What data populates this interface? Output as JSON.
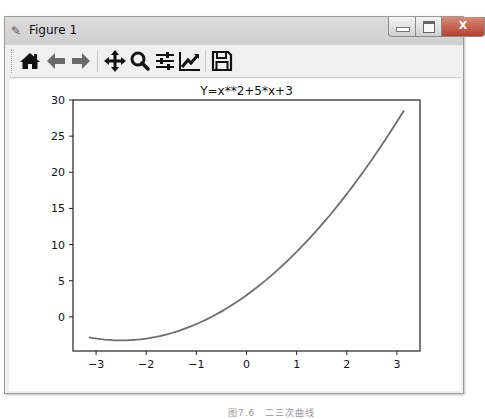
{
  "window": {
    "title": "Figure 1",
    "controls": {
      "minimize": "minimize",
      "maximize": "maximize",
      "close": "X"
    }
  },
  "toolbar": {
    "items": [
      {
        "name": "home",
        "icon": "home-icon",
        "glyph": "⌂"
      },
      {
        "name": "back",
        "icon": "arrow-left-icon",
        "glyph": "←"
      },
      {
        "name": "forward",
        "icon": "arrow-right-icon",
        "glyph": "→"
      },
      {
        "name": "pan",
        "icon": "move-icon",
        "glyph": "✥"
      },
      {
        "name": "zoom",
        "icon": "magnifier-icon",
        "glyph": "🔍"
      },
      {
        "name": "configure-subplots",
        "icon": "sliders-icon",
        "glyph": "☰"
      },
      {
        "name": "edit-axis",
        "icon": "line-chart-icon",
        "glyph": "📈"
      },
      {
        "name": "save",
        "icon": "floppy-disk-icon",
        "glyph": "💾"
      }
    ]
  },
  "caption": "图7.6　二三次曲线",
  "chart_data": {
    "type": "line",
    "title": "Y=x**2+5*x+3",
    "xlabel": "",
    "ylabel": "",
    "xlim": [
      -3.46,
      3.46
    ],
    "ylim": [
      -4.72,
      30.0
    ],
    "xticks": [
      -3,
      -2,
      -1,
      0,
      1,
      2,
      3
    ],
    "xtick_labels": [
      "−3",
      "−2",
      "−1",
      "0",
      "1",
      "2",
      "3"
    ],
    "yticks": [
      0,
      5,
      10,
      15,
      20,
      25,
      30
    ],
    "ytick_labels": [
      "0",
      "5",
      "10",
      "15",
      "20",
      "25",
      "30"
    ],
    "grid": false,
    "legend": null,
    "series": [
      {
        "name": "Y=x**2+5*x+3",
        "color": "#6e6e6e",
        "x": [
          -3.14,
          -3.0,
          -2.5,
          -2.0,
          -1.5,
          -1.0,
          -0.5,
          0.0,
          0.5,
          1.0,
          1.5,
          2.0,
          2.5,
          3.0,
          3.14
        ],
        "y": [
          -2.84,
          -3.0,
          -3.25,
          -3.0,
          -2.25,
          -1.0,
          0.75,
          3.0,
          5.75,
          9.0,
          12.75,
          17.0,
          21.75,
          27.0,
          28.58
        ]
      }
    ]
  }
}
